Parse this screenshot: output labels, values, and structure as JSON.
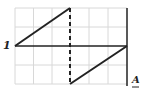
{
  "diagram": {
    "type": "sawtooth-waveform-on-grid",
    "left_label": "1",
    "right_label": "A",
    "grid": {
      "cols": 6,
      "rows": 4,
      "color": "#d8d8d8"
    },
    "stroke_color": "#222222",
    "waveform": {
      "segments": [
        {
          "from": [
            0,
            0
          ],
          "to": [
            3,
            2
          ],
          "style": "solid"
        },
        {
          "from": [
            3,
            2
          ],
          "to": [
            3,
            -2
          ],
          "style": "dashed"
        },
        {
          "from": [
            3,
            -2
          ],
          "to": [
            6,
            0
          ],
          "style": "solid"
        }
      ],
      "axis_y": 0,
      "end_marker_x": 6
    }
  }
}
